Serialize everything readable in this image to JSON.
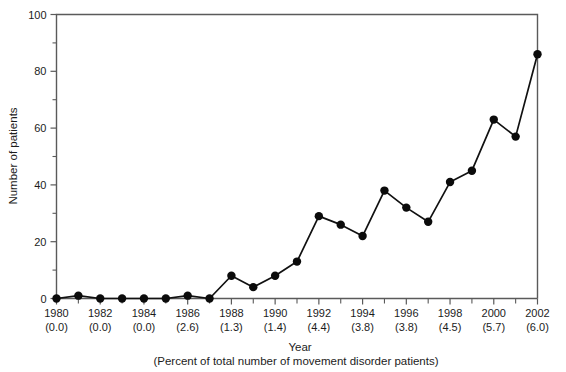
{
  "chart_data": {
    "type": "line",
    "title": "",
    "xlabel": "Year",
    "xlabel_sub": "(Percent of total number of movement disorder patients)",
    "ylabel": "Number of patients",
    "ylim": [
      0,
      100
    ],
    "yticks": [
      0,
      20,
      40,
      60,
      80,
      100
    ],
    "ytick_labels": [
      "0",
      "20",
      "40",
      "60",
      "80",
      "100"
    ],
    "grid": false,
    "legend": "none",
    "x": [
      1980,
      1981,
      1982,
      1983,
      1984,
      1985,
      1986,
      1987,
      1988,
      1989,
      1990,
      1991,
      1992,
      1993,
      1994,
      1995,
      1996,
      1997,
      1998,
      1999,
      2000,
      2001,
      2002
    ],
    "values": [
      0,
      1,
      0,
      0,
      0,
      0,
      1,
      0,
      8,
      4,
      8,
      13,
      29,
      26,
      22,
      38,
      32,
      27,
      41,
      45,
      63,
      57,
      86
    ],
    "xtick_labels": [
      "1980",
      "",
      "1982",
      "",
      "1984",
      "",
      "1986",
      "",
      "1988",
      "",
      "1990",
      "",
      "1992",
      "",
      "1994",
      "",
      "1996",
      "",
      "1998",
      "",
      "2000",
      "",
      "2002"
    ],
    "xtick_sublabels": [
      "(0.0)",
      "",
      "(0.0)",
      "",
      "(0.0)",
      "",
      "(2.6)",
      "",
      "(1.3)",
      "",
      "(1.4)",
      "",
      "(4.4)",
      "",
      "(3.8)",
      "",
      "(3.8)",
      "",
      "(4.5)",
      "",
      "(5.7)",
      "",
      "(6.0)"
    ],
    "series_color": "#0b0b0b",
    "axis_color": "#5a5a5a"
  }
}
